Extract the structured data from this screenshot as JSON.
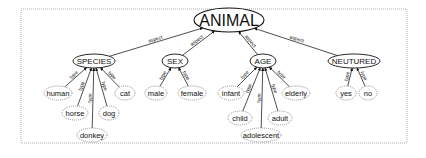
{
  "diagram": {
    "type": "concept-tree",
    "root": {
      "label": "ANIMAL",
      "x": 229,
      "y": 20,
      "rx": 35,
      "ry": 12
    },
    "categories": [
      {
        "id": "species",
        "label": "SPECIES",
        "x": 94,
        "y": 61,
        "rx": 21,
        "ry": 7,
        "edge_label": "aspect"
      },
      {
        "id": "sex",
        "label": "SEX",
        "x": 175,
        "y": 61,
        "rx": 13,
        "ry": 7,
        "edge_label": "aspect"
      },
      {
        "id": "age",
        "label": "AGE",
        "x": 263,
        "y": 61,
        "rx": 13,
        "ry": 7,
        "edge_label": "aspect"
      },
      {
        "id": "neutured",
        "label": "NEUTURED",
        "x": 354,
        "y": 61,
        "rx": 26,
        "ry": 7,
        "edge_label": "aspect"
      }
    ],
    "leaves": [
      {
        "label": "human",
        "parent": "species",
        "x": 58,
        "y": 93,
        "rx": 14,
        "edge_label": "type"
      },
      {
        "label": "horse",
        "parent": "species",
        "x": 75,
        "y": 113,
        "rx": 13,
        "edge_label": "type"
      },
      {
        "label": "donkey",
        "parent": "species",
        "x": 92,
        "y": 135,
        "rx": 15,
        "edge_label": "type"
      },
      {
        "label": "dog",
        "parent": "species",
        "x": 109,
        "y": 113,
        "rx": 10,
        "edge_label": "type"
      },
      {
        "label": "cat",
        "parent": "species",
        "x": 125,
        "y": 93,
        "rx": 10,
        "edge_label": "type"
      },
      {
        "label": "male",
        "parent": "sex",
        "x": 156,
        "y": 93,
        "rx": 11,
        "edge_label": "type"
      },
      {
        "label": "female",
        "parent": "sex",
        "x": 192,
        "y": 93,
        "rx": 14,
        "edge_label": "type"
      },
      {
        "label": "infant",
        "parent": "age",
        "x": 231,
        "y": 93,
        "rx": 13,
        "edge_label": "type"
      },
      {
        "label": "child",
        "parent": "age",
        "x": 240,
        "y": 118,
        "rx": 12,
        "edge_label": "type"
      },
      {
        "label": "adolescent",
        "parent": "age",
        "x": 261,
        "y": 135,
        "rx": 20,
        "edge_label": "type"
      },
      {
        "label": "adult",
        "parent": "age",
        "x": 280,
        "y": 118,
        "rx": 12,
        "edge_label": "type"
      },
      {
        "label": "elderly",
        "parent": "age",
        "x": 296,
        "y": 93,
        "rx": 14,
        "edge_label": "type"
      },
      {
        "label": "yes",
        "parent": "neutured",
        "x": 346,
        "y": 93,
        "rx": 10,
        "edge_label": "type"
      },
      {
        "label": "no",
        "parent": "neutured",
        "x": 368,
        "y": 93,
        "rx": 9,
        "edge_label": "type"
      }
    ],
    "frame": {
      "x": 21,
      "y": 9,
      "width": 386,
      "height": 134
    }
  }
}
